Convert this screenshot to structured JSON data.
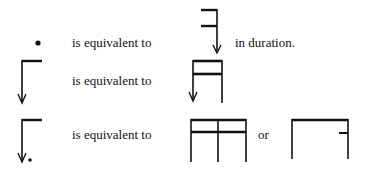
{
  "rows": [
    {
      "left_symbol": "dot-note",
      "phrase": "is equivalent to",
      "right_symbol": "single-hook-stem-arrow",
      "suffix": "in duration."
    },
    {
      "left_symbol": "flag-stem-arrow",
      "phrase": "is equivalent to",
      "right_symbol": "double-beam-two-stems-arrow"
    },
    {
      "left_symbol": "flag-stem-arrow-dotted",
      "phrase": "is equivalent to",
      "right_symbol": "double-beam-three-stems",
      "connector": "or",
      "alt_symbol": "single-beam-two-stems-tick"
    }
  ],
  "colors": {
    "ink": "#111111",
    "background": "#ffffff"
  }
}
